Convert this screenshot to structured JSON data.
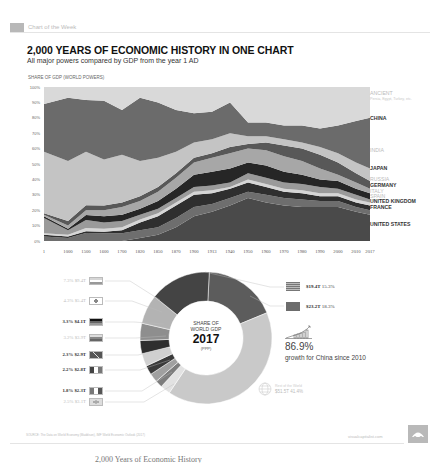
{
  "header": {
    "section_label": "Chart of the Week"
  },
  "title": "2,000 YEARS OF ECONOMIC HISTORY IN ONE CHART",
  "subtitle": "All major powers compared by GDP from the year 1 AD",
  "caption": "2,000 Years of Economic History",
  "chart_data": [
    {
      "type": "area",
      "stacked": true,
      "normalized": true,
      "title": "SHARE OF GDP (WORLD POWERS)",
      "xlabel": "",
      "ylabel": "Share of GDP",
      "ylim": [
        0,
        100
      ],
      "yticks": [
        "0%",
        "10%",
        "20%",
        "30%",
        "40%",
        "50%",
        "60%",
        "70%",
        "80%",
        "90%",
        "100%"
      ],
      "x": [
        "1",
        "1000",
        "1500",
        "1600",
        "1700",
        "1820",
        "1850",
        "1870",
        "1900",
        "1913",
        "1940",
        "1950",
        "1960",
        "1970",
        "1980",
        "1990",
        "2000",
        "2010",
        "2017"
      ],
      "grid": false,
      "legend_position": "right",
      "series": [
        {
          "name": "UNITED STATES",
          "values": [
            0,
            0,
            0,
            0,
            0,
            2,
            4,
            9,
            16,
            19,
            23,
            28,
            25,
            23,
            22,
            22,
            22,
            19,
            17
          ]
        },
        {
          "name": "FRANCE",
          "values": [
            3,
            2,
            5,
            5,
            5,
            5,
            5,
            6,
            6,
            5,
            5,
            4,
            5,
            5,
            5,
            4,
            4,
            3,
            3
          ]
        },
        {
          "name": "UNITED KINGDOM",
          "values": [
            1,
            1,
            1,
            1,
            2,
            5,
            7,
            8,
            8,
            7,
            6,
            6,
            5,
            4,
            4,
            3,
            3,
            3,
            3
          ]
        },
        {
          "name": "SPAIN",
          "values": [
            1,
            1,
            2,
            2,
            2,
            2,
            2,
            2,
            2,
            2,
            1,
            2,
            2,
            2,
            2,
            2,
            2,
            2,
            2
          ]
        },
        {
          "name": "ITALY",
          "values": [
            10,
            3,
            5,
            4,
            4,
            3,
            3,
            3,
            3,
            3,
            3,
            4,
            4,
            4,
            4,
            4,
            3,
            3,
            2
          ]
        },
        {
          "name": "GERMANY",
          "values": [
            1,
            1,
            3,
            4,
            4,
            4,
            5,
            6,
            8,
            9,
            9,
            7,
            8,
            7,
            6,
            5,
            5,
            4,
            4
          ]
        },
        {
          "name": "RUSSIA",
          "values": [
            1,
            2,
            3,
            4,
            5,
            5,
            6,
            7,
            8,
            9,
            10,
            9,
            10,
            10,
            9,
            7,
            4,
            4,
            3
          ]
        },
        {
          "name": "JAPAN",
          "values": [
            1,
            3,
            3,
            3,
            3,
            3,
            3,
            3,
            3,
            3,
            4,
            3,
            5,
            7,
            8,
            9,
            8,
            6,
            5
          ]
        },
        {
          "name": "INDIA",
          "values": [
            40,
            39,
            33,
            30,
            31,
            23,
            19,
            14,
            10,
            9,
            9,
            5,
            4,
            4,
            4,
            5,
            6,
            7,
            8
          ]
        },
        {
          "name": "CHINA",
          "values": [
            31,
            41,
            32,
            38,
            29,
            41,
            36,
            27,
            19,
            18,
            20,
            9,
            9,
            9,
            11,
            12,
            18,
            27,
            33
          ]
        },
        {
          "name": "ANCIENT",
          "values": [
            11,
            7,
            8,
            9,
            15,
            7,
            10,
            15,
            17,
            16,
            10,
            23,
            23,
            25,
            25,
            27,
            25,
            22,
            20
          ]
        }
      ],
      "series_colors": [
        "#4a4a4a",
        "#6e6e6e",
        "#2f2f2f",
        "#d6d6d6",
        "#9a9a9a",
        "#262626",
        "#a7a7a7",
        "#585858",
        "#c4c4c4",
        "#6b6b6b",
        "#d9d9d9"
      ],
      "right_labels": [
        {
          "text": "ANCIENT",
          "sub": "Persia, Egypt, Turkey, etc.",
          "style": "light",
          "y": 94
        },
        {
          "text": "CHINA",
          "style": "dark",
          "y": 119
        },
        {
          "text": "INDIA",
          "style": "light",
          "y": 151
        },
        {
          "text": "JAPAN",
          "style": "dark",
          "y": 169
        },
        {
          "text": "RUSSIA",
          "style": "light",
          "y": 180
        },
        {
          "text": "GERMANY",
          "style": "dark",
          "y": 186
        },
        {
          "text": "ITALY",
          "style": "light",
          "y": 192
        },
        {
          "text": "SPAIN",
          "style": "light",
          "y": 197
        },
        {
          "text": "UNITED KINGDOM",
          "style": "dark",
          "y": 202
        },
        {
          "text": "FRANCE",
          "style": "dark",
          "y": 208
        },
        {
          "text": "UNITED STATES",
          "style": "dark",
          "y": 225
        }
      ]
    },
    {
      "type": "pie",
      "donut": true,
      "title": "SHARE OF WORLD GDP 2017 (PPP)",
      "center": {
        "line1": "SHARE OF",
        "line2": "WORLD GDP",
        "year": "2017",
        "note": "(PPP)"
      },
      "slices": [
        {
          "label": "China",
          "value": 18.3,
          "gdp": "$23.2T",
          "color": "#5c5c5c"
        },
        {
          "label": "Rest of the World",
          "value": 41.4,
          "gdp": "$51.5T",
          "color": "#c9c9c9"
        },
        {
          "label": "Brazil",
          "value": 2.5,
          "gdp": "$3.1T",
          "color": "#e2e2e2"
        },
        {
          "label": "Italy",
          "value": 1.8,
          "gdp": "$2.3T",
          "color": "#7d7d7d"
        },
        {
          "label": "France",
          "value": 2.2,
          "gdp": "$2.8T",
          "color": "#a0a0a0"
        },
        {
          "label": "United Kingdom",
          "value": 2.3,
          "gdp": "$2.9T",
          "color": "#3a3a3a"
        },
        {
          "label": "Russia",
          "value": 3.2,
          "gdp": "$3.9T",
          "color": "#d0d0d0"
        },
        {
          "label": "Germany",
          "value": 3.3,
          "gdp": "$4.1T",
          "color": "#2e2e2e"
        },
        {
          "label": "Japan",
          "value": 4.3,
          "gdp": "$5.4T",
          "color": "#8e8e8e"
        },
        {
          "label": "India",
          "value": 7.3,
          "gdp": "$9.4T",
          "color": "#b3b3b3"
        },
        {
          "label": "United States",
          "value": 15.3,
          "gdp": "$19.4T",
          "color": "#444444"
        }
      ]
    }
  ],
  "left_legend": [
    {
      "pct": "7.3%",
      "gdp": "$9.4T",
      "style": "light",
      "flag": "india",
      "y": 277
    },
    {
      "pct": "4.3%",
      "gdp": "$5.4T",
      "style": "light",
      "flag": "japan",
      "y": 297
    },
    {
      "pct": "3.3%",
      "gdp": "$4.1T",
      "style": "dark",
      "flag": "germany",
      "y": 318
    },
    {
      "pct": "3.2%",
      "gdp": "$3.9T",
      "style": "light",
      "flag": "russia",
      "y": 334
    },
    {
      "pct": "2.3%",
      "gdp": "$2.9T",
      "style": "dark",
      "flag": "uk",
      "y": 351
    },
    {
      "pct": "2.2%",
      "gdp": "$2.8T",
      "style": "dark",
      "flag": "france",
      "y": 366
    },
    {
      "pct": "1.8%",
      "gdp": "$2.3T",
      "style": "dark",
      "flag": "italy",
      "y": 387
    },
    {
      "pct": "2.5%",
      "gdp": "$3.1T",
      "style": "light",
      "flag": "brazil",
      "y": 398
    }
  ],
  "right_legend": [
    {
      "gdp": "$19.4T",
      "pct": "15.3%",
      "flag": "usa",
      "y": 282
    },
    {
      "gdp": "$23.2T",
      "pct": "18.3%",
      "flag": "china",
      "y": 302
    }
  ],
  "growth": {
    "value": "86.9%",
    "text": "growth for China since 2010"
  },
  "rest_of_world": {
    "label": "Rest of the World",
    "value": "$51.5T  41.4%"
  },
  "footer": {
    "source": "SOURCE: The Data on World Economy (Maddison), IMF World Economic Outlook (2017)",
    "site": "visualcapitalist.com"
  }
}
